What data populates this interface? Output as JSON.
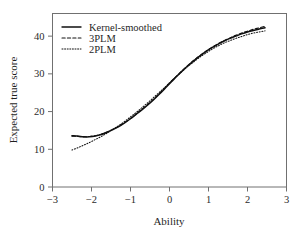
{
  "chart_data": {
    "type": "line",
    "title": "",
    "xlabel": "Ability",
    "ylabel": "Expected true score",
    "xlim": [
      -3,
      3
    ],
    "ylim": [
      0,
      46
    ],
    "xticks": [
      -3,
      -2,
      -1,
      0,
      1,
      2,
      3
    ],
    "xticklabels": [
      "-3",
      "-2",
      "-1",
      "0",
      "1",
      "2",
      "3"
    ],
    "yticks": [
      0,
      10,
      20,
      30,
      40
    ],
    "yticklabels": [
      "0",
      "10",
      "20",
      "30",
      "40"
    ],
    "grid": false,
    "legend_position": "upper left",
    "series": [
      {
        "name": "Kernel-smoothed",
        "style": "solid",
        "color": "#101010",
        "x": [
          -2.5,
          -2.35,
          -2.2,
          -2.05,
          -1.9,
          -1.75,
          -1.6,
          -1.45,
          -1.3,
          -1.15,
          -1.0,
          -0.85,
          -0.7,
          -0.55,
          -0.4,
          -0.25,
          -0.1,
          0.05,
          0.2,
          0.35,
          0.5,
          0.65,
          0.8,
          0.95,
          1.1,
          1.25,
          1.4,
          1.55,
          1.7,
          1.85,
          2.0,
          2.15,
          2.3,
          2.45
        ],
        "y": [
          13.6,
          13.5,
          13.3,
          13.3,
          13.5,
          13.9,
          14.5,
          15.2,
          16.0,
          17.0,
          18.1,
          19.3,
          20.5,
          21.8,
          23.2,
          24.7,
          26.3,
          27.9,
          29.5,
          31.0,
          32.4,
          33.7,
          34.9,
          36.0,
          37.0,
          37.9,
          38.7,
          39.4,
          40.0,
          40.6,
          41.1,
          41.5,
          41.9,
          42.2
        ]
      },
      {
        "name": "3PLM",
        "style": "dashed",
        "color": "#101010",
        "x": [
          -2.5,
          -2.35,
          -2.2,
          -2.05,
          -1.9,
          -1.75,
          -1.6,
          -1.45,
          -1.3,
          -1.15,
          -1.0,
          -0.85,
          -0.7,
          -0.55,
          -0.4,
          -0.25,
          -0.1,
          0.05,
          0.2,
          0.35,
          0.5,
          0.65,
          0.8,
          0.95,
          1.1,
          1.25,
          1.4,
          1.55,
          1.7,
          1.85,
          2.0,
          2.15,
          2.3,
          2.45
        ],
        "y": [
          13.5,
          13.4,
          13.3,
          13.4,
          13.6,
          14.0,
          14.6,
          15.3,
          16.1,
          17.1,
          18.2,
          19.4,
          20.7,
          22.0,
          23.4,
          24.9,
          26.5,
          28.1,
          29.6,
          31.1,
          32.5,
          33.8,
          35.0,
          36.1,
          37.1,
          38.0,
          38.8,
          39.5,
          40.2,
          40.8,
          41.3,
          41.8,
          42.2,
          42.6
        ]
      },
      {
        "name": "2PLM",
        "style": "dotted",
        "color": "#101010",
        "x": [
          -2.5,
          -2.35,
          -2.2,
          -2.05,
          -1.9,
          -1.75,
          -1.6,
          -1.45,
          -1.3,
          -1.15,
          -1.0,
          -0.85,
          -0.7,
          -0.55,
          -0.4,
          -0.25,
          -0.1,
          0.05,
          0.2,
          0.35,
          0.5,
          0.65,
          0.8,
          0.95,
          1.1,
          1.25,
          1.4,
          1.55,
          1.7,
          1.85,
          2.0,
          2.15,
          2.3,
          2.45
        ],
        "y": [
          9.8,
          10.4,
          11.1,
          11.8,
          12.6,
          13.4,
          14.3,
          15.3,
          16.3,
          17.4,
          18.6,
          19.8,
          21.1,
          22.4,
          23.8,
          25.2,
          26.6,
          28.1,
          29.5,
          30.9,
          32.2,
          33.4,
          34.6,
          35.6,
          36.6,
          37.4,
          38.2,
          38.8,
          39.4,
          39.9,
          40.4,
          40.8,
          41.1,
          41.4
        ]
      }
    ]
  },
  "legend": {
    "items": [
      {
        "label": "Kernel-smoothed",
        "style": "solid"
      },
      {
        "label": "3PLM",
        "style": "dashed"
      },
      {
        "label": "2PLM",
        "style": "dotted"
      }
    ]
  },
  "axes": {
    "x_title": "Ability",
    "y_title": "Expected true score"
  }
}
